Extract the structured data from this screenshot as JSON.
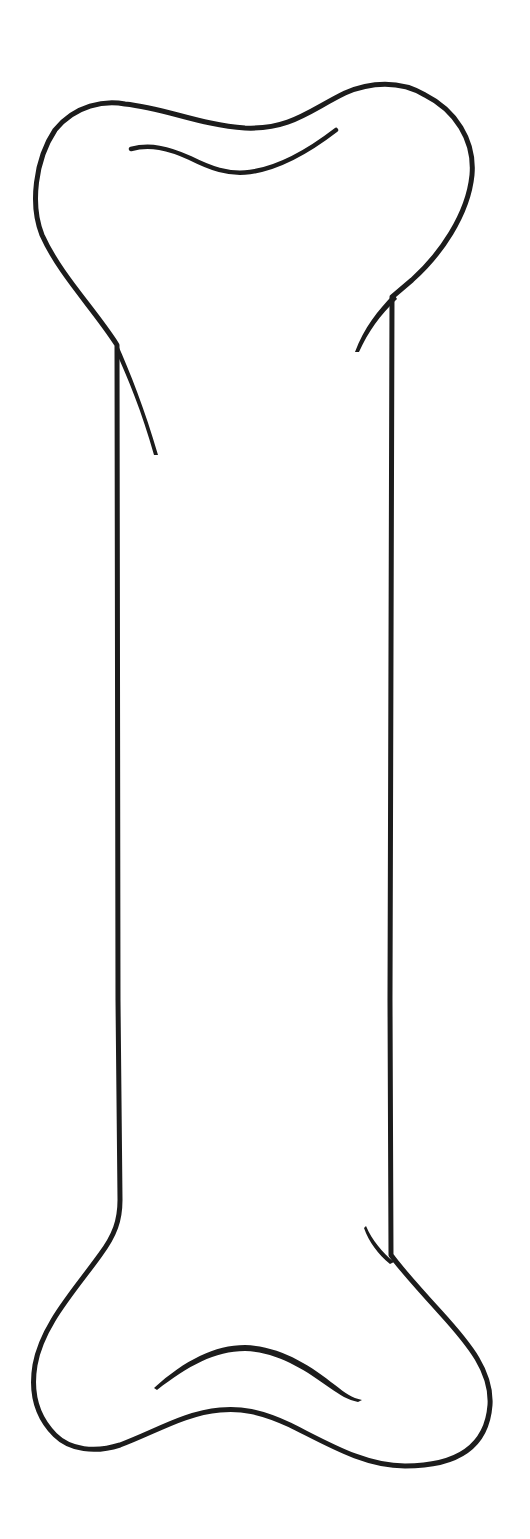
{
  "image": {
    "subject": "bone-outline-drawing",
    "background_color": "#ffffff",
    "line_color": "#1c1c1c",
    "orientation": "vertical"
  }
}
